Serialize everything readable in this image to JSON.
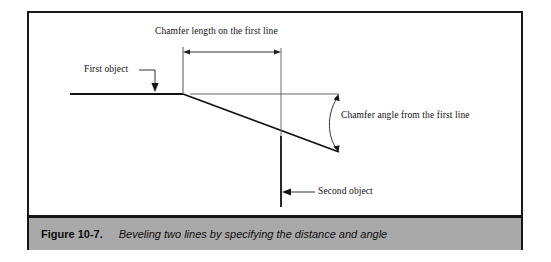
{
  "figure": {
    "caption_number": "Figure 10-7.",
    "caption_text": "Beveling two lines by specifying the distance and angle"
  },
  "diagram": {
    "labels": {
      "chamfer_length": "Chamfer length on the first line",
      "first_object": "First object",
      "chamfer_angle": "Chamfer angle from the first line",
      "second_object": "Second object"
    }
  },
  "colors": {
    "caption_background": "#a9a9a9",
    "frame_border": "#1a1a1a",
    "line_primary": "#111111",
    "line_thin": "#555555",
    "page_background": "#ffffff"
  }
}
